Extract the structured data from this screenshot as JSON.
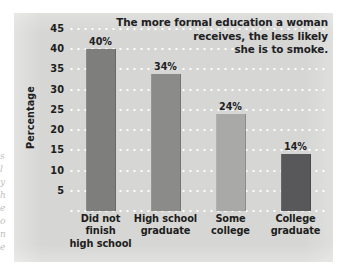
{
  "chart_data": {
    "type": "bar",
    "title": "The more formal education a woman receives, the less likely she is to smoke.",
    "title_lines": [
      "The more formal education a woman",
      "receives, the less likely",
      "she is to smoke."
    ],
    "xlabel": "",
    "ylabel": "Percentage",
    "ylim": [
      0,
      45
    ],
    "ytick_step": 5,
    "yticks": [
      45,
      40,
      35,
      30,
      25,
      20,
      15,
      10,
      5
    ],
    "ytick_labels": [
      "45",
      "40",
      "35",
      "30",
      "25",
      "20",
      "15",
      "10",
      "5"
    ],
    "grid": "horizontal-dotted-white",
    "legend": "none",
    "categories": [
      "Did not finish high school",
      "High school graduate",
      "Some college",
      "College graduate"
    ],
    "category_lines": [
      [
        "Did not",
        "finish",
        "high school"
      ],
      [
        "High school",
        "graduate"
      ],
      [
        "Some",
        "college"
      ],
      [
        "College",
        "graduate"
      ]
    ],
    "values": [
      40,
      34,
      24,
      14
    ],
    "value_labels": [
      "40%",
      "34%",
      "24%",
      "14%"
    ],
    "bar_colors": [
      "#7e7e7c",
      "#8b8b89",
      "#a9a9a7",
      "#58585a"
    ],
    "panel_color": "#d6d6d4",
    "gridline_color": "#ffffff",
    "text_color": "#1d1d1c"
  },
  "scan_artifacts": {
    "lines": [
      "s",
      "l",
      "y",
      "h",
      "e",
      "o",
      "n",
      "e"
    ]
  }
}
